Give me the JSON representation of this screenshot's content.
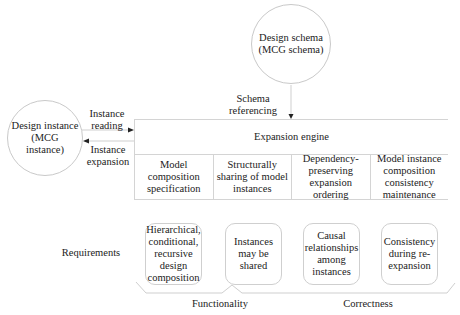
{
  "schema_node": {
    "label_line1": "Design schema",
    "label_line2": "(MCG schema)"
  },
  "instance_node": {
    "label_line1": "Design instance",
    "label_line2": "(MCG",
    "label_line3": "instance)"
  },
  "edges": {
    "instance_reading": {
      "line1": "Instance",
      "line2": "reading"
    },
    "instance_expansion": {
      "line1": "Instance",
      "line2": "expansion"
    },
    "schema_referencing": {
      "line1": "Schema",
      "line2": "referencing"
    }
  },
  "engine": {
    "title": "Expansion engine",
    "components": [
      {
        "lines": [
          "Model",
          "composition",
          "specification"
        ]
      },
      {
        "lines": [
          "Structurally",
          "sharing of model",
          "instances"
        ]
      },
      {
        "lines": [
          "Dependency-",
          "preserving",
          "expansion",
          "ordering"
        ]
      },
      {
        "lines": [
          "Model instance",
          "composition",
          "consistency",
          "maintenance"
        ]
      }
    ]
  },
  "requirements": {
    "label": "Requirements",
    "items": [
      {
        "lines": [
          "Hierarchical,",
          "conditional,",
          "recursive",
          "design",
          "composition"
        ]
      },
      {
        "lines": [
          "Instances",
          "may be",
          "shared"
        ]
      },
      {
        "lines": [
          "Causal",
          "relationships",
          "among",
          "instances"
        ]
      },
      {
        "lines": [
          "Consistency",
          "during re-",
          "expansion"
        ]
      }
    ]
  },
  "groups": {
    "functionality": "Functionality",
    "correctness": "Correctness"
  },
  "colors": {
    "line": "#cfcfcf",
    "arrow": "#222222",
    "text": "#222222"
  }
}
